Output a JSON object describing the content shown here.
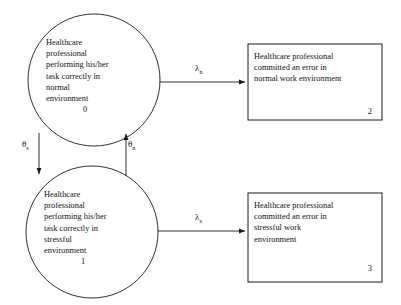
{
  "diagram": {
    "type": "state-transition-diagram",
    "stroke_color": "#1a1a1a",
    "background_color": "#ffffff",
    "states": [
      {
        "id": "0",
        "shape": "circle",
        "label": "Healthcare\nprofessional\nperforming his/her\ntask correctly in\nnormal\nenvironment"
      },
      {
        "id": "1",
        "shape": "circle",
        "label": "Healthcare\nprofessional\nperforming his/her\ntask correctly in\nstressful\nenvironment"
      },
      {
        "id": "2",
        "shape": "rectangle",
        "label": "Healthcare professional\ncommitted an error in\nnormal work environment"
      },
      {
        "id": "3",
        "shape": "rectangle",
        "label": "Healthcare professional\ncommitted an error in\nstressful work\nenvironment"
      }
    ],
    "transitions": [
      {
        "name": "lambda-n",
        "symbol": "λ",
        "subscript": "n",
        "from": "0",
        "to": "2",
        "direction": "right"
      },
      {
        "name": "lambda-s",
        "symbol": "λ",
        "subscript": "s",
        "from": "1",
        "to": "3",
        "direction": "right"
      },
      {
        "name": "theta-s",
        "symbol": "θ",
        "subscript": "s",
        "from": "0",
        "to": "1",
        "direction": "down"
      },
      {
        "name": "theta-n",
        "symbol": "θ",
        "subscript": "n",
        "from": "1",
        "to": "0",
        "direction": "up"
      }
    ]
  }
}
